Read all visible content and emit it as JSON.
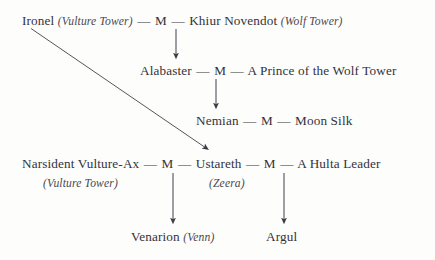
{
  "diagram": {
    "type": "family-tree",
    "title": "",
    "marriage_token": "M",
    "connector": "—",
    "background_color": "#fdfdfc",
    "ink_color": "#33323a",
    "generations": [
      {
        "id": "gen-1",
        "row": 1,
        "people": [
          {
            "id": "ironel",
            "name": "Ironel",
            "house": "(Vulture Tower)"
          },
          {
            "id": "khiur",
            "name": "Khiur Novendot",
            "house": "(Wolf Tower)"
          }
        ],
        "union_text": "Ironel (Vulture Tower) — M — Khiur Novendot (Wolf Tower)"
      },
      {
        "id": "gen-2",
        "row": 2,
        "people": [
          {
            "id": "alabaster",
            "name": "Alabaster",
            "house": ""
          },
          {
            "id": "wolf-prince",
            "name": "A Prince of the Wolf Tower",
            "house": ""
          }
        ],
        "union_text": "Alabaster — M — A Prince of the Wolf Tower"
      },
      {
        "id": "gen-3",
        "row": 3,
        "people": [
          {
            "id": "nemian",
            "name": "Nemian",
            "house": ""
          },
          {
            "id": "moon-silk",
            "name": "Moon Silk",
            "house": ""
          }
        ],
        "union_text": "Nemian — M — Moon Silk"
      },
      {
        "id": "gen-4",
        "row": 4,
        "people": [
          {
            "id": "narsident",
            "name": "Narsident Vulture-Ax",
            "house": "(Vulture Tower)"
          },
          {
            "id": "ustareth",
            "name": "Ustareth",
            "house": "(Zeera)"
          },
          {
            "id": "hulta-leader",
            "name": "A Hulta Leader",
            "house": ""
          }
        ],
        "union_text": "Narsident Vulture-Ax — M — Ustareth — M — A Hulta Leader"
      },
      {
        "id": "gen-5",
        "row": 5,
        "people": [
          {
            "id": "venarion",
            "name": "Venarion",
            "house": "(Venn)"
          },
          {
            "id": "argul",
            "name": "Argul",
            "house": ""
          }
        ],
        "union_text": "Venarion (Venn)        Argul"
      }
    ],
    "labels": {
      "ironel_name": "Ironel",
      "ironel_house": "(Vulture Tower)",
      "khiur_name": "Khiur Novendot",
      "khiur_house": "(Wolf Tower)",
      "alabaster_name": "Alabaster",
      "wolf_prince_name": "A Prince of the Wolf Tower",
      "nemian_name": "Nemian",
      "moon_silk_name": "Moon Silk",
      "narsident_name": "Narsident Vulture-Ax",
      "narsident_house": "(Vulture Tower)",
      "ustareth_name": "Ustareth",
      "ustareth_house": "(Zeera)",
      "hulta_leader_name": "A Hulta Leader",
      "venarion_name": "Venarion",
      "venarion_house": "(Venn)",
      "argul_name": "Argul",
      "m1": "M",
      "m2": "M",
      "m3": "M",
      "m4": "M",
      "m5": "M",
      "dash_1a": "—",
      "dash_1b": "—",
      "dash_2a": "—",
      "dash_2b": "—",
      "dash_3a": "—",
      "dash_3b": "—",
      "dash_4a": "—",
      "dash_4b": "—",
      "dash_4c": "—",
      "dash_4d": "—"
    },
    "edges": [
      {
        "id": "edge-ironel-khiur-to-alabaster",
        "from": "gen-1",
        "to": "alabaster",
        "kind": "descent-arrow-vertical"
      },
      {
        "id": "edge-alabaster-prince-to-nemian",
        "from": "gen-2",
        "to": "nemian",
        "kind": "descent-arrow-vertical"
      },
      {
        "id": "edge-ironel-to-ustareth",
        "from": "ironel",
        "to": "ustareth",
        "kind": "descent-arrow-diagonal"
      },
      {
        "id": "edge-narsident-ustareth-to-venarion",
        "from": "gen-4-left-union",
        "to": "venarion",
        "kind": "descent-arrow-vertical"
      },
      {
        "id": "edge-ustareth-hulta-to-argul",
        "from": "gen-4-right-union",
        "to": "argul",
        "kind": "descent-arrow-vertical"
      }
    ]
  }
}
